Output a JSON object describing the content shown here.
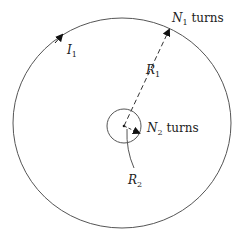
{
  "diagram": {
    "type": "coaxial-coils",
    "outer_coil": {
      "label_var": "N",
      "label_sub": "1",
      "label_suffix": " turns",
      "radius_var": "R",
      "radius_sub": "1",
      "current_var": "I",
      "current_sub": "1"
    },
    "inner_coil": {
      "label_var": "N",
      "label_sub": "2",
      "label_suffix": " turns",
      "radius_var": "R",
      "radius_sub": "2"
    },
    "colors": {
      "stroke": "#555555",
      "text": "#222222",
      "arrow": "#111111"
    }
  }
}
